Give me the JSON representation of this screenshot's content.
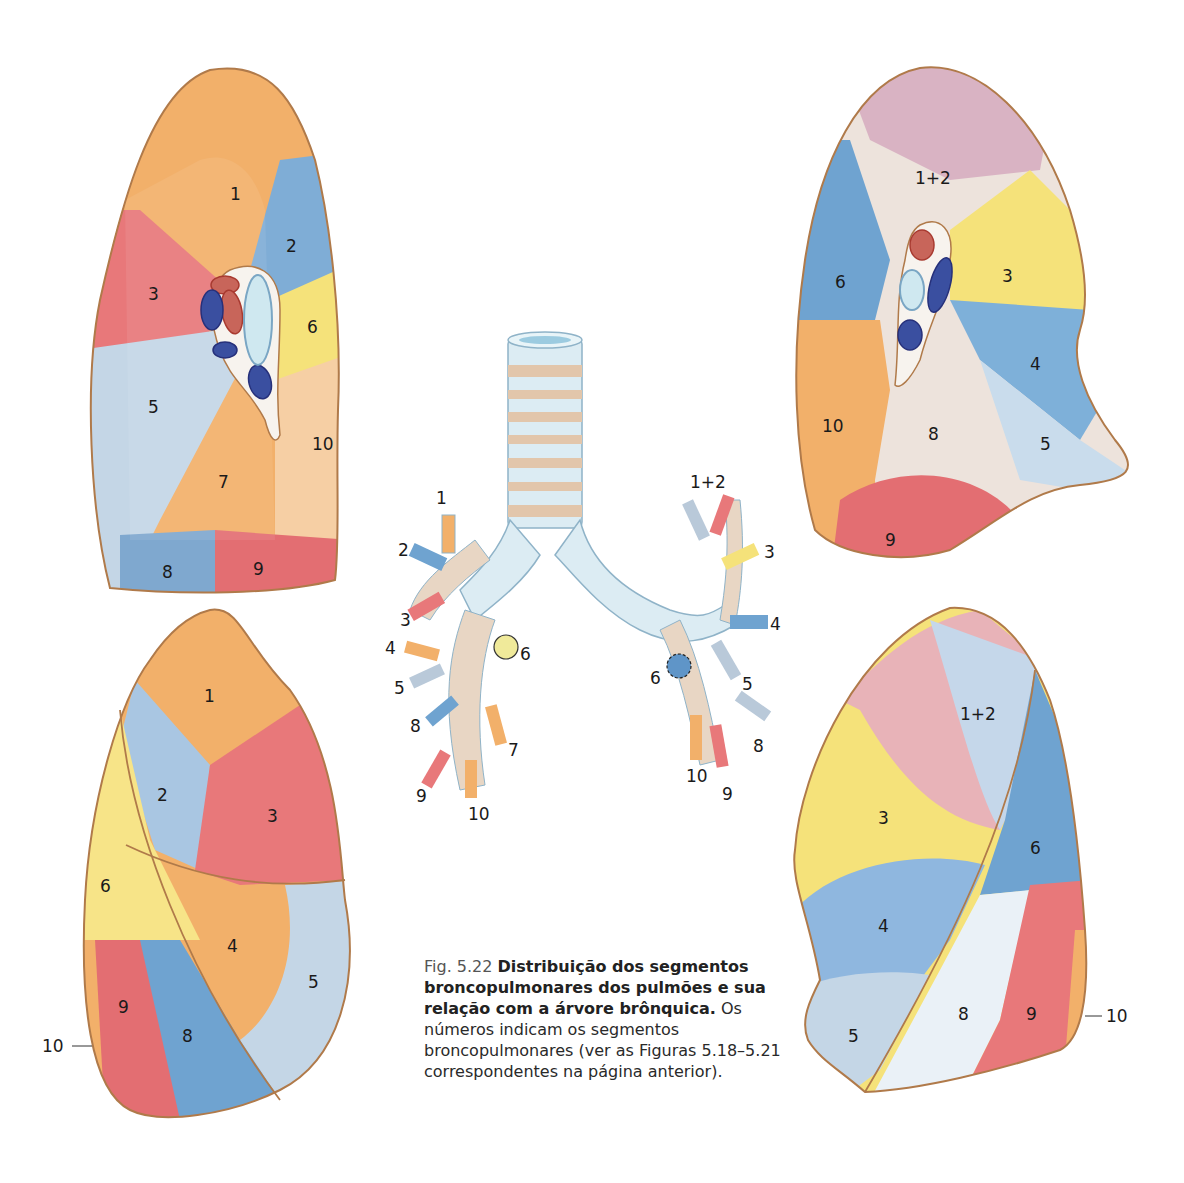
{
  "figure": {
    "number": "Fig. 5.22",
    "title": "Distribuição dos segmentos broncopulmonares dos pulmões e sua relação com a árvore brônquica.",
    "description": "Os números indicam os segmentos broncopulmonares (ver as Figuras 5.18–5.21 correspondentes na página anterior)."
  },
  "colors": {
    "orange": "#f2b06a",
    "red": "#e8787a",
    "blue": "#6fa3d0",
    "light_blue": "#c4d6e6",
    "yellow": "#f5e27a",
    "peach": "#f6cfa4",
    "outline": "#b07a4a",
    "vein": "#3a4fa0",
    "artery": "#c8655a",
    "bronchus": "#cfe8f0"
  },
  "panels": {
    "right_lung_medial": {
      "labels": {
        "s1": "1",
        "s2": "2",
        "s3": "3",
        "s5": "5",
        "s6": "6",
        "s7": "7",
        "s8": "8",
        "s9": "9",
        "s10": "10"
      }
    },
    "left_lung_medial": {
      "labels": {
        "s12": "1+2",
        "s3": "3",
        "s4": "4",
        "s5": "5",
        "s6": "6",
        "s8": "8",
        "s9": "9",
        "s10": "10"
      }
    },
    "right_lung_lateral": {
      "labels": {
        "s1": "1",
        "s2": "2",
        "s3": "3",
        "s4": "4",
        "s5": "5",
        "s6": "6",
        "s8": "8",
        "s9": "9",
        "s10": "10"
      }
    },
    "left_lung_lateral": {
      "labels": {
        "s12": "1+2",
        "s3": "3",
        "s4": "4",
        "s5": "5",
        "s6": "6",
        "s8": "8",
        "s9": "9",
        "s10": "10"
      }
    },
    "bronchial_tree": {
      "right_labels": {
        "b1": "1",
        "b2": "2",
        "b3": "3",
        "b4": "4",
        "b5": "5",
        "b6": "6",
        "b7": "7",
        "b8": "8",
        "b9": "9",
        "b10": "10"
      },
      "left_labels": {
        "b12": "1+2",
        "b3": "3",
        "b4": "4",
        "b5": "5",
        "b6": "6",
        "b8": "8",
        "b9": "9",
        "b10": "10"
      }
    }
  }
}
